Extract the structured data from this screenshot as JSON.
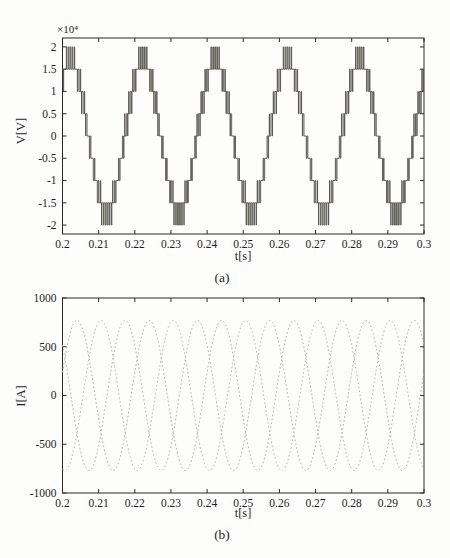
{
  "figure": {
    "background": "#fdfdfb",
    "axis_color": "#2a2a28",
    "tick_label_color": "#1e1e1c"
  },
  "chart_data": [
    {
      "name": "voltage-waveform",
      "type": "line",
      "subtype": "nine-level-pwm-inverter-voltage-staircase",
      "title": "(a)",
      "xlabel": "t[s]",
      "ylabel": "V[V]",
      "y_multiplier": "×10⁴",
      "xlim": [
        0.2,
        0.3
      ],
      "ylim": [
        -22000,
        22000
      ],
      "xticks": [
        0.2,
        0.21,
        0.22,
        0.23,
        0.24,
        0.25,
        0.26,
        0.27,
        0.28,
        0.29,
        0.3
      ],
      "xtick_labels": [
        "0.2",
        "0.21",
        "0.22",
        "0.23",
        "0.24",
        "0.25",
        "0.26",
        "0.27",
        "0.28",
        "0.29",
        "0.3"
      ],
      "yticks": [
        20000,
        15000,
        10000,
        5000,
        0,
        -5000,
        -10000,
        -15000,
        -20000
      ],
      "ytick_labels": [
        "2",
        "1.5",
        "1",
        "0.5",
        "0",
        "-0.5",
        "-1",
        "-1.5",
        "-2"
      ],
      "grid": false,
      "legend": null,
      "line_color": "#55524b",
      "plot_rect": {
        "x": 62.5,
        "y": 38,
        "w": 361.5,
        "h": 196
      },
      "signal": {
        "fundamental_hz": 50,
        "cycles_shown": 5,
        "num_levels": 9,
        "level_step_V": 5000,
        "peak_level_V": 20000,
        "modulation_amplitude_V": 17000,
        "carrier_hz": 1800,
        "first_positive_peak_s": 0.2022
      }
    },
    {
      "name": "current-waveform",
      "type": "line",
      "subtype": "three-phase-sinusoidal-load-currents",
      "title": "(b)",
      "xlabel": "t[s]",
      "ylabel": "I[A]",
      "xlim": [
        0.2,
        0.3
      ],
      "ylim": [
        -1000,
        1000
      ],
      "xticks": [
        0.2,
        0.21,
        0.22,
        0.23,
        0.24,
        0.25,
        0.26,
        0.27,
        0.28,
        0.29,
        0.3
      ],
      "xtick_labels": [
        "0.2",
        "0.21",
        "0.22",
        "0.23",
        "0.24",
        "0.25",
        "0.26",
        "0.27",
        "0.28",
        "0.29",
        "0.3"
      ],
      "yticks": [
        1000,
        500,
        0,
        -500,
        -1000
      ],
      "ytick_labels": [
        "1000",
        "500",
        "0",
        "-500",
        "-1000"
      ],
      "grid": false,
      "legend": null,
      "plot_rect": {
        "x": 62.5,
        "y": 298,
        "w": 361.5,
        "h": 195
      },
      "series": [
        {
          "name": "phase-a-current",
          "amplitude_A": 770,
          "fundamental_hz": 50,
          "first_positive_peak_s": 0.204,
          "color": "#aeaba4",
          "dash": "1.6 2.4"
        },
        {
          "name": "phase-b-current",
          "amplitude_A": 770,
          "fundamental_hz": 50,
          "first_positive_peak_s": 0.21067,
          "color": "#b8b5ae",
          "dash": "1.6 2.4"
        },
        {
          "name": "phase-c-current",
          "amplitude_A": 770,
          "fundamental_hz": 50,
          "first_positive_peak_s": 0.19733,
          "color": "#b3b0a9",
          "dash": "1.6 2.4"
        }
      ]
    }
  ]
}
